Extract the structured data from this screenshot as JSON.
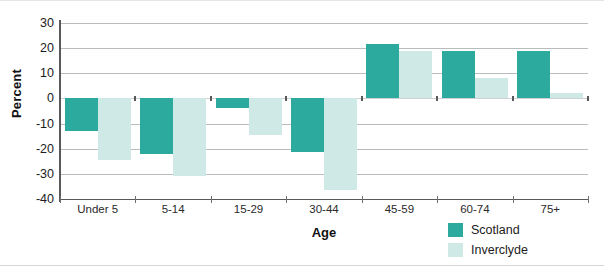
{
  "chart_data": {
    "type": "bar",
    "title": "",
    "xlabel": "Age",
    "ylabel": "Percent",
    "categories": [
      "Under 5",
      "5-14",
      "15-29",
      "30-44",
      "45-59",
      "60-74",
      "75+"
    ],
    "series": [
      {
        "name": "Scotland",
        "color": "#2daa9e",
        "values": [
          -13,
          -22,
          -4,
          -21.5,
          21.5,
          19,
          19
        ]
      },
      {
        "name": "Inverclyde",
        "color": "#cfeae6",
        "values": [
          -24.5,
          -31,
          -14.5,
          -36.5,
          19,
          8,
          2
        ]
      }
    ],
    "ylim": [
      -40,
      30
    ],
    "yticks": [
      30,
      20,
      10,
      0,
      -10,
      -20,
      -30,
      -40
    ],
    "ytick_labels": [
      "30",
      "20",
      "10",
      "0",
      "-10",
      "-20",
      "-30",
      "-40"
    ],
    "grid": true,
    "legend_position": "bottom-right"
  },
  "legend": {
    "items": [
      {
        "label": "Scotland",
        "color": "#2daa9e"
      },
      {
        "label": "Inverclyde",
        "color": "#cfeae6"
      }
    ]
  }
}
